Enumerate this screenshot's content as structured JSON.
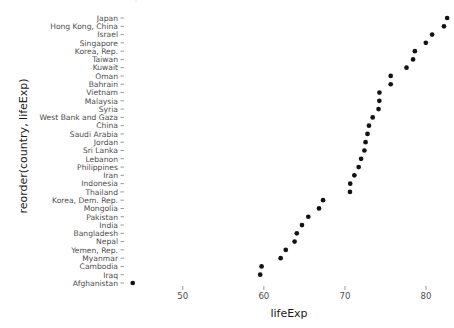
{
  "chart_data": {
    "type": "scatter",
    "title": "",
    "subtitle": "",
    "xlabel": "lifeExp",
    "ylabel": "reorder(country, lifeExp)",
    "xlim": [
      43.0,
      83.2
    ],
    "xticks": [
      50,
      60,
      70,
      80
    ],
    "xtick_labels": [
      "50",
      "60",
      "70",
      "80"
    ],
    "grid": false,
    "legend": "none",
    "point_color": "#121212",
    "panel_background": "#ffffff",
    "axis_text_color": "#4d4d4d",
    "axis_title_color": "#1a1a1a",
    "categories": [
      "Japan",
      "Hong Kong, China",
      "Israel",
      "Singapore",
      "Korea, Rep.",
      "Taiwan",
      "Kuwait",
      "Oman",
      "Bahrain",
      "Vietnam",
      "Malaysia",
      "Syria",
      "West Bank and Gaza",
      "China",
      "Saudi Arabia",
      "Jordan",
      "Sri Lanka",
      "Lebanon",
      "Philippines",
      "Iran",
      "Indonesia",
      "Thailand",
      "Korea, Dem. Rep.",
      "Mongolia",
      "Pakistan",
      "India",
      "Bangladesh",
      "Nepal",
      "Yemen, Rep.",
      "Myanmar",
      "Cambodia",
      "Iraq",
      "Afghanistan"
    ],
    "values": [
      82.6,
      82.21,
      80.75,
      79.97,
      78.62,
      78.4,
      77.59,
      75.64,
      75.64,
      74.25,
      74.24,
      74.14,
      73.42,
      72.96,
      72.78,
      72.54,
      72.4,
      71.99,
      71.69,
      71.16,
      70.65,
      70.62,
      67.3,
      66.8,
      65.48,
      64.7,
      64.06,
      63.79,
      62.7,
      62.07,
      59.72,
      59.55,
      43.83
    ],
    "series": [
      {
        "name": "lifeExp",
        "values": [
          82.6,
          82.21,
          80.75,
          79.97,
          78.62,
          78.4,
          77.59,
          75.64,
          75.64,
          74.25,
          74.24,
          74.14,
          73.42,
          72.96,
          72.78,
          72.54,
          72.4,
          71.99,
          71.69,
          71.16,
          70.65,
          70.62,
          67.3,
          66.8,
          65.48,
          64.7,
          64.06,
          63.79,
          62.7,
          62.07,
          59.72,
          59.55,
          43.83
        ]
      }
    ]
  }
}
